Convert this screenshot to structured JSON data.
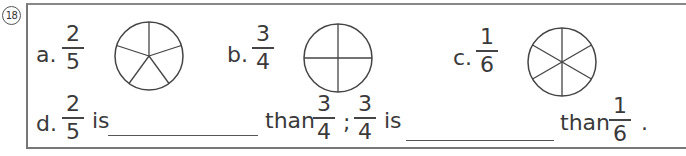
{
  "question_number": "18",
  "items": [
    {
      "letter": "a.",
      "numerator": "2",
      "denominator": "5",
      "pie_parts": 5
    },
    {
      "letter": "b.",
      "numerator": "3",
      "denominator": "4",
      "pie_parts": 4
    },
    {
      "letter": "c.",
      "numerator": "1",
      "denominator": "6",
      "pie_parts": 6
    }
  ],
  "sentence": {
    "letter": "d.",
    "frac1": {
      "numerator": "2",
      "denominator": "5"
    },
    "is1": "is",
    "than1": "than",
    "frac2": {
      "numerator": "3",
      "denominator": "4"
    },
    "separator": ";",
    "frac3": {
      "numerator": "3",
      "denominator": "4"
    },
    "is2": "is",
    "than2": "than",
    "frac4": {
      "numerator": "1",
      "denominator": "6"
    },
    "end": "."
  }
}
